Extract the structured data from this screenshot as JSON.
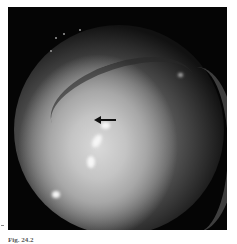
{
  "figure": {
    "alt": "Endoscopic view showing pale rounded mass with arrow indicating lesion",
    "annotation": "arrow-pointing-left",
    "colors": {
      "background": "#050505",
      "mucosa_light": "#d9d9d9",
      "arrow": "#111111"
    }
  },
  "caption": {
    "label": "Fig. 24.2"
  }
}
